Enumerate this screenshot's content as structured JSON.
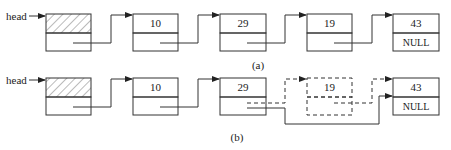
{
  "diagrams": [
    {
      "caption": "(a)",
      "head_label": "head",
      "nodes": [
        {
          "data": "",
          "next": "",
          "is_head_node": true
        },
        {
          "data": "10",
          "next": ""
        },
        {
          "data": "29",
          "next": ""
        },
        {
          "data": "19",
          "next": ""
        },
        {
          "data": "43",
          "next": "NULL"
        }
      ]
    },
    {
      "caption": "(b)",
      "head_label": "head",
      "nodes": [
        {
          "data": "",
          "next": "",
          "is_head_node": true
        },
        {
          "data": "10",
          "next": ""
        },
        {
          "data": "29",
          "next": ""
        },
        {
          "data": "19",
          "next": "",
          "deleted": true
        },
        {
          "data": "43",
          "next": "NULL"
        }
      ]
    }
  ],
  "colors": {
    "line": "#333333",
    "hatch": "#555555",
    "background": "#ffffff"
  }
}
